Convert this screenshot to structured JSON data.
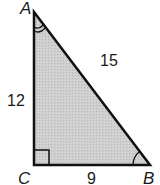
{
  "figure": {
    "type": "right-triangle",
    "fill_color": "#c8c8c8",
    "stroke_color": "#111111",
    "vertices": [
      {
        "label": "A",
        "x": 34,
        "y": 12
      },
      {
        "label": "C",
        "x": 34,
        "y": 165
      },
      {
        "label": "B",
        "x": 150,
        "y": 165
      }
    ],
    "sides": {
      "AC": "12",
      "AB": "15",
      "CB": "9"
    },
    "right_angle_at": "C",
    "angle_marks": [
      "A",
      "B"
    ]
  }
}
